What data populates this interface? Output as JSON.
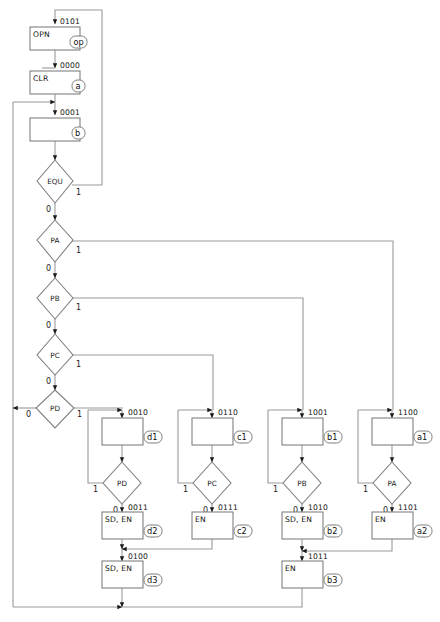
{
  "diagram": {
    "type": "asm-state-flowchart",
    "background_color": "#ffffff",
    "line_color": "#9a9a9a",
    "box_stroke_color": "#808080",
    "text_color": "#1a1a1a"
  },
  "states": [
    {
      "id": "op",
      "tag": "op",
      "code": "0101",
      "output": "OPN"
    },
    {
      "id": "a",
      "tag": "a",
      "code": "0000",
      "output": "CLR"
    },
    {
      "id": "b",
      "tag": "b",
      "code": "0001",
      "output": ""
    },
    {
      "id": "d1",
      "tag": "d1",
      "code": "0010",
      "output": ""
    },
    {
      "id": "d2",
      "tag": "d2",
      "code": "0011",
      "output": "SD, EN"
    },
    {
      "id": "d3",
      "tag": "d3",
      "code": "0100",
      "output": "SD, EN"
    },
    {
      "id": "c1",
      "tag": "c1",
      "code": "0110",
      "output": ""
    },
    {
      "id": "c2",
      "tag": "c2",
      "code": "0111",
      "output": "EN"
    },
    {
      "id": "b1",
      "tag": "b1",
      "code": "1001",
      "output": ""
    },
    {
      "id": "b2",
      "tag": "b2",
      "code": "1010",
      "output": "SD, EN"
    },
    {
      "id": "b3",
      "tag": "b3",
      "code": "1011",
      "output": "EN"
    },
    {
      "id": "a1",
      "tag": "a1",
      "code": "1100",
      "output": ""
    },
    {
      "id": "a2",
      "tag": "a2",
      "code": "1101",
      "output": "EN"
    }
  ],
  "decisions": [
    {
      "id": "equ",
      "label": "EQU",
      "branch_left": "0",
      "branch_right": "1"
    },
    {
      "id": "pa",
      "label": "PA",
      "branch_left": "0",
      "branch_right": "1"
    },
    {
      "id": "pb",
      "label": "PB",
      "branch_left": "0",
      "branch_right": "1"
    },
    {
      "id": "pc",
      "label": "PC",
      "branch_left": "0",
      "branch_right": "1"
    },
    {
      "id": "pd",
      "label": "PD",
      "branch_left": "0",
      "branch_right": "1"
    },
    {
      "id": "pd_d",
      "label": "PD",
      "branch_left": "1",
      "branch_right": "0"
    },
    {
      "id": "pc_c",
      "label": "PC",
      "branch_left": "1",
      "branch_right": "0"
    },
    {
      "id": "pb_b",
      "label": "PB",
      "branch_left": "1",
      "branch_right": "0"
    },
    {
      "id": "pa_a",
      "label": "PA",
      "branch_left": "1",
      "branch_right": "0"
    }
  ],
  "labels": {
    "code_op": "0101",
    "code_a": "0000",
    "code_b": "0001",
    "code_d1": "0010",
    "code_d2": "0011",
    "code_d3": "0100",
    "code_c1": "0110",
    "code_c2": "0111",
    "code_b1": "1001",
    "code_b2": "1010",
    "code_b3": "1011",
    "code_a1": "1100",
    "code_a2": "1101",
    "out_op": "OPN",
    "out_a": "CLR",
    "out_d2": "SD, EN",
    "out_d3": "SD, EN",
    "out_c2": "EN",
    "out_b2": "SD, EN",
    "out_b3": "EN",
    "out_a2": "EN",
    "tag_op": "op",
    "tag_a": "a",
    "tag_b": "b",
    "tag_d1": "d1",
    "tag_d2": "d2",
    "tag_d3": "d3",
    "tag_c1": "c1",
    "tag_c2": "c2",
    "tag_b1": "b1",
    "tag_b2": "b2",
    "tag_b3": "b3",
    "tag_a1": "a1",
    "tag_a2": "a2",
    "dec_equ": "EQU",
    "dec_pa": "PA",
    "dec_pb": "PB",
    "dec_pc": "PC",
    "dec_pd": "PD",
    "dec_pd_d": "PD",
    "dec_pc_c": "PC",
    "dec_pb_b": "PB",
    "dec_pa_a": "PA",
    "zero": "0",
    "one": "1"
  }
}
